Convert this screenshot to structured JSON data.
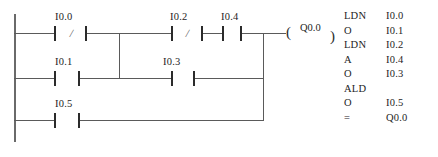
{
  "diagram": {
    "type": "ladder-logic-with-instruction-list",
    "ladder": {
      "contacts": [
        {
          "id": "c1",
          "label": "I0.0",
          "kind": "normally-closed",
          "rung": 1
        },
        {
          "id": "c2",
          "label": "I0.2",
          "kind": "normally-closed",
          "rung": 1
        },
        {
          "id": "c3",
          "label": "I0.4",
          "kind": "normally-open",
          "rung": 1
        },
        {
          "id": "c4",
          "label": "I0.1",
          "kind": "normally-open",
          "rung": 2
        },
        {
          "id": "c5",
          "label": "I0.3",
          "kind": "normally-open",
          "rung": 2
        },
        {
          "id": "c6",
          "label": "I0.5",
          "kind": "normally-open",
          "rung": 3
        }
      ],
      "coil": {
        "label": "Q0.0",
        "open_paren": "(",
        "close_paren": ")"
      },
      "negation_marks": {
        "c1": "/",
        "c2": "/"
      }
    },
    "instruction_list": [
      {
        "op": "LDN",
        "arg": "I0.0"
      },
      {
        "op": "O",
        "arg": "I0.1"
      },
      {
        "op": "LDN",
        "arg": "I0.2"
      },
      {
        "op": "A",
        "arg": "I0.4"
      },
      {
        "op": "O",
        "arg": "I0.3"
      },
      {
        "op": "ALD",
        "arg": ""
      },
      {
        "op": "O",
        "arg": "I0.5"
      },
      {
        "op": "=",
        "arg": "Q0.0"
      }
    ]
  }
}
